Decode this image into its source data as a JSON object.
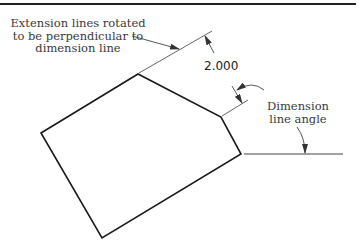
{
  "diagram": {
    "type": "technical-drawing-dimensioning",
    "dimension_value": "2.000",
    "annotations": {
      "extension_lines": "Extension lines rotated\nto be perpendicular to\ndimension line",
      "dimension_angle": "Dimension\nline angle"
    },
    "shape": {
      "kind": "pentagon",
      "vertices": [
        [
          41,
          133
        ],
        [
          138,
          74
        ],
        [
          221,
          117
        ],
        [
          241,
          154
        ],
        [
          102,
          238
        ]
      ]
    },
    "colors": {
      "outline": "#1a1a1a",
      "thin_line": "#555555",
      "text": "#3a3a3a",
      "border": "#222222"
    }
  }
}
